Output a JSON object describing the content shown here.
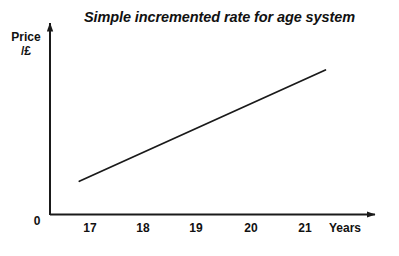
{
  "chart_data": {
    "type": "line",
    "title": "Simple incremented rate for age system",
    "xlabel": "Years",
    "ylabel": "Price /£",
    "ylabel_lines": [
      "Price",
      "/£"
    ],
    "origin_label": "0",
    "xlim": [
      16.0,
      21.9
    ],
    "ylim": [
      0,
      100
    ],
    "grid": false,
    "legend": false,
    "xticks": [
      {
        "label": "17",
        "value": 17
      },
      {
        "label": "18",
        "value": 18
      },
      {
        "label": "19",
        "value": 19
      },
      {
        "label": "20",
        "value": 20
      },
      {
        "label": "21",
        "value": 21
      }
    ],
    "yticks": [],
    "series": [
      {
        "name": "price",
        "x": [
          16.8,
          21.4
        ],
        "values": [
          24,
          103
        ],
        "color": "#1a1a1a"
      }
    ],
    "annotations": []
  },
  "axes": {
    "x_axis_arrow": "arrow-right",
    "y_axis_arrow": "arrow-up",
    "axis_color": "#1a1a1a"
  }
}
